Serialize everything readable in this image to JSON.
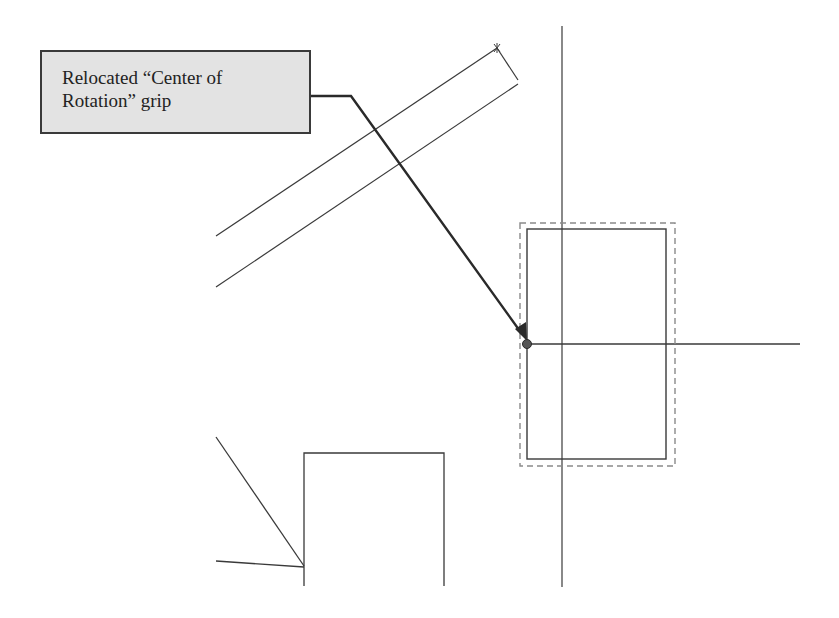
{
  "callout": {
    "line1": "Relocated “Center of",
    "line2": "Rotation” grip"
  },
  "colors": {
    "background": "#ffffff",
    "callout_fill": "#e3e3e3",
    "line": "#3a3a3a",
    "dashed": "#8a8a8a"
  },
  "icons": {
    "grip": "center-of-rotation-grip-icon",
    "arrow": "leader-arrow-icon"
  }
}
